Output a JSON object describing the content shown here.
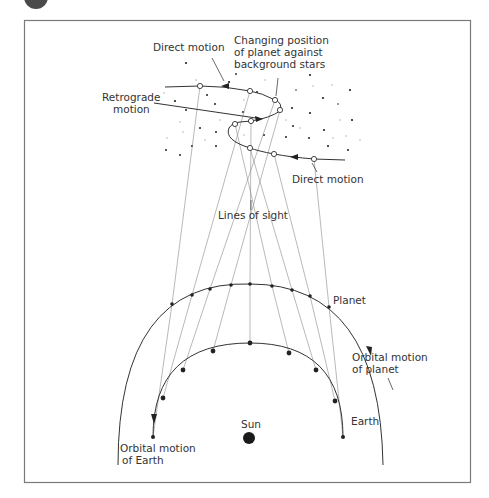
{
  "figure": {
    "badge_color": "#4a4a4a",
    "frame_color": "#7a7a7a",
    "labels": {
      "direct_motion_top": "Direct motion",
      "changing_position_line1": "Changing position",
      "changing_position_line2": "of planet against",
      "changing_position_line3": "background stars",
      "retrograde_line1": "Retrograde",
      "retrograde_line2": "motion",
      "direct_motion_bottom": "Direct motion",
      "lines_of_sight": "Lines of sight",
      "planet": "Planet",
      "orbital_motion_planet_line1": "Orbital motion",
      "orbital_motion_planet_line2": "of planet",
      "sun": "Sun",
      "earth": "Earth",
      "orbital_motion_earth_line1": "Orbital motion",
      "orbital_motion_earth_line2": "of Earth"
    },
    "earth_positions": [
      [
        343,
        437
      ],
      [
        335,
        401
      ],
      [
        316,
        370
      ],
      [
        289,
        353
      ],
      [
        250,
        343
      ],
      [
        213,
        351
      ],
      [
        183,
        370
      ],
      [
        163,
        398
      ],
      [
        153,
        437
      ]
    ],
    "planet_positions": [
      [
        329,
        307
      ],
      [
        310,
        296
      ],
      [
        292,
        290
      ],
      [
        272,
        286
      ],
      [
        250,
        284
      ],
      [
        231,
        285
      ],
      [
        210,
        289
      ],
      [
        192,
        295
      ],
      [
        172,
        304
      ]
    ],
    "sky_positions": [
      [
        314,
        159
      ],
      [
        274,
        154
      ],
      [
        250,
        148
      ],
      [
        235,
        124
      ],
      [
        251,
        121
      ],
      [
        280,
        110
      ],
      [
        275,
        100
      ],
      [
        250,
        91
      ],
      [
        200,
        86
      ]
    ],
    "sun_position": [
      249,
      438
    ]
  }
}
